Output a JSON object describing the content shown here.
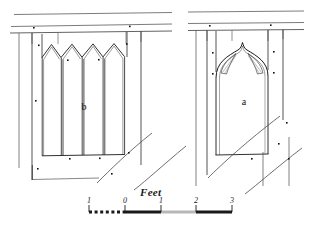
{
  "figure": {
    "type": "architectural-elevation-drawing",
    "ink_color": "#1a1a1a",
    "background_color": "#ffffff",
    "stroke_light": "#7a7a7a"
  },
  "panels": [
    {
      "id": "b",
      "label": "b",
      "label_x": 84,
      "label_y": 106,
      "description": "Four-light window with pointed arch heads",
      "lights": 4
    },
    {
      "id": "a",
      "label": "a",
      "label_x": 244,
      "label_y": 101,
      "description": "Single ogee-arched window with cusped tracery",
      "lights": 1
    }
  ],
  "scale": {
    "title": "Feet",
    "title_x": 155,
    "title_y": 193,
    "unit": "feet",
    "ticks": [
      {
        "label": "1",
        "value": -1,
        "x": 89
      },
      {
        "label": "0",
        "value": 0,
        "x": 125
      },
      {
        "label": "1",
        "value": 1,
        "x": 161
      },
      {
        "label": "2",
        "value": 2,
        "x": 196
      },
      {
        "label": "3",
        "value": 3,
        "x": 232
      }
    ],
    "bar_y": 212,
    "bar_left": 89,
    "bar_right": 232,
    "segments": [
      {
        "from": -1,
        "to": 0,
        "style": "dashed",
        "fill": "#1a1a1a"
      },
      {
        "from": 0,
        "to": 1,
        "style": "solid",
        "fill": "#1a1a1a"
      },
      {
        "from": 1,
        "to": 2,
        "style": "solid",
        "fill": "#b8b8b8"
      },
      {
        "from": 2,
        "to": 3,
        "style": "solid",
        "fill": "#1a1a1a"
      }
    ]
  }
}
